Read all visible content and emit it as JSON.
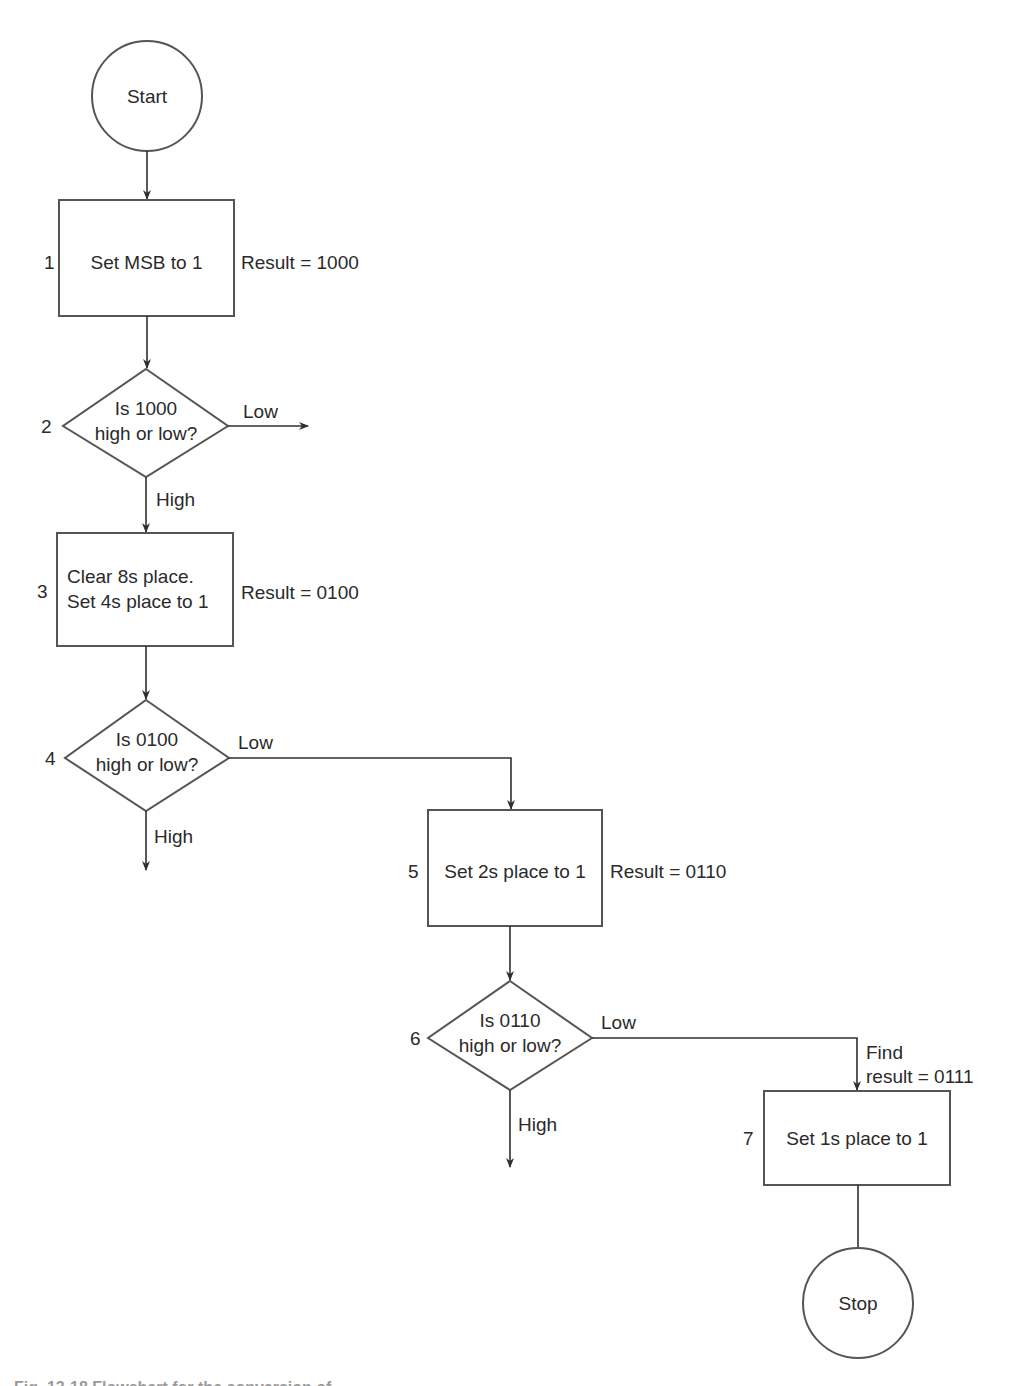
{
  "diagram": {
    "type": "flowchart",
    "start": {
      "label": "Start"
    },
    "stop": {
      "label": "Stop"
    },
    "steps": [
      {
        "number": "1",
        "kind": "process",
        "lines": [
          "Set MSB to 1"
        ],
        "note": "Result = 1000"
      },
      {
        "number": "2",
        "kind": "decision",
        "lines": [
          "Is 1000",
          "high or low?"
        ],
        "low_label": "Low",
        "high_label": "High"
      },
      {
        "number": "3",
        "kind": "process",
        "lines": [
          "Clear 8s place.",
          "Set 4s place to 1"
        ],
        "note": "Result = 0100"
      },
      {
        "number": "4",
        "kind": "decision",
        "lines": [
          "Is 0100",
          "high or low?"
        ],
        "low_label": "Low",
        "high_label": "High"
      },
      {
        "number": "5",
        "kind": "process",
        "lines": [
          "Set 2s place to 1"
        ],
        "note": "Result = 0110"
      },
      {
        "number": "6",
        "kind": "decision",
        "lines": [
          "Is 0110",
          "high or low?"
        ],
        "low_label": "Low",
        "high_label": "High"
      },
      {
        "number": "7",
        "kind": "process",
        "lines": [
          "Set 1s place to 1"
        ],
        "note_lines": [
          "Find",
          "result = 0111"
        ]
      }
    ],
    "colors": {
      "line": "#2f2f2f",
      "outline": "#555555",
      "text": "#2a2a2a",
      "background": "#ffffff"
    }
  },
  "caption": {
    "text": "Fig. 13-18 Flowchart for the conversion of ..."
  }
}
